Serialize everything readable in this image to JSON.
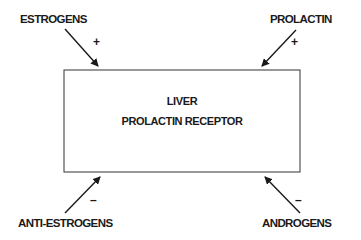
{
  "diagram": {
    "center": {
      "line1": "LIVER",
      "line2": "PROLACTIN RECEPTOR"
    },
    "inputs": [
      {
        "label": "ESTROGENS",
        "sign": "+",
        "position": "top-left"
      },
      {
        "label": "PROLACTIN",
        "sign": "+",
        "position": "top-right"
      },
      {
        "label": "ANTI-ESTROGENS",
        "sign": "–",
        "position": "bottom-left"
      },
      {
        "label": "ANDROGENS",
        "sign": "–",
        "position": "bottom-right"
      }
    ]
  }
}
